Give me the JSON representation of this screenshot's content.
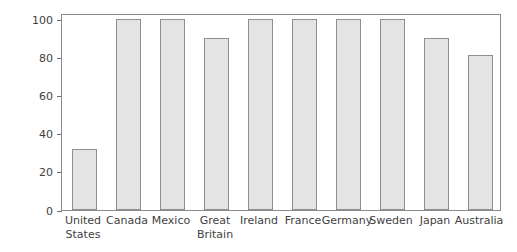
{
  "chart_data": {
    "type": "bar",
    "title": "",
    "xlabel": "",
    "ylabel": "Percent",
    "ylim": [
      0,
      100
    ],
    "yticks": [
      0,
      20,
      40,
      60,
      80,
      100
    ],
    "ytick_labels": [
      "0",
      "20",
      "40",
      "60",
      "80",
      "100"
    ],
    "grid": false,
    "legend": "none",
    "categories": [
      "United States",
      "Canada",
      "Mexico",
      "Great Britain",
      "Ireland",
      "France",
      "Germany",
      "Sweden",
      "Japan",
      "Australia"
    ],
    "category_lines": [
      [
        "United",
        "States"
      ],
      [
        "Canada"
      ],
      [
        "Mexico"
      ],
      [
        "Great",
        "Britain"
      ],
      [
        "Ireland"
      ],
      [
        "France"
      ],
      [
        "Germany"
      ],
      [
        "Sweden"
      ],
      [
        "Japan"
      ],
      [
        "Australia"
      ]
    ],
    "values": [
      32,
      100,
      100,
      90,
      100,
      100,
      100,
      100,
      90,
      81
    ],
    "colors": {
      "bar_fill": "#e4e4e4",
      "bar_edge": "#8f8f8f",
      "axis": "#8a8a8a",
      "text": "#3f3f3f",
      "background": "#ffffff"
    }
  }
}
